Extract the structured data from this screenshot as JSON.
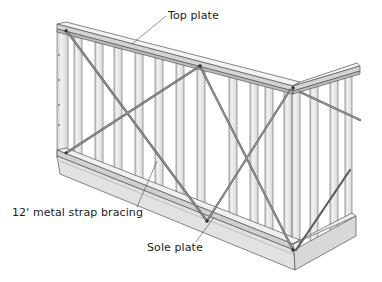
{
  "figure": {
    "labels": {
      "top_plate": "Top plate",
      "strap_bracing": "12' metal strap bracing",
      "sole_plate": "Sole plate"
    },
    "colors": {
      "background": "#ffffff",
      "wood_light": "#eeeeee",
      "wood_mid": "#d9d9d9",
      "wood_dark": "#bdbdbd",
      "outline": "#555555",
      "strap": "#6e6e6e",
      "text": "#1a1a1a"
    }
  }
}
